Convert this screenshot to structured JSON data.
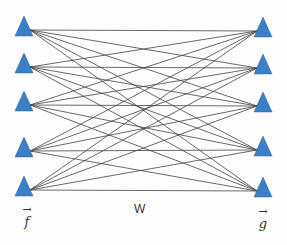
{
  "diagram": {
    "type": "fully-connected bipartite network",
    "left_layer": {
      "label": "f",
      "vector": true,
      "node_count": 5
    },
    "right_layer": {
      "label": "g",
      "vector": true,
      "node_count": 5
    },
    "weights_label": "W",
    "node_color": "#3b7fc4",
    "edge_color": "#444444",
    "left_nodes": [
      {
        "x": 24,
        "y": 26
      },
      {
        "x": 24,
        "y": 63
      },
      {
        "x": 24,
        "y": 101
      },
      {
        "x": 24,
        "y": 147
      },
      {
        "x": 24,
        "y": 186
      }
    ],
    "right_nodes": [
      {
        "x": 263,
        "y": 27
      },
      {
        "x": 263,
        "y": 64
      },
      {
        "x": 263,
        "y": 102
      },
      {
        "x": 263,
        "y": 146
      },
      {
        "x": 263,
        "y": 187
      }
    ]
  }
}
